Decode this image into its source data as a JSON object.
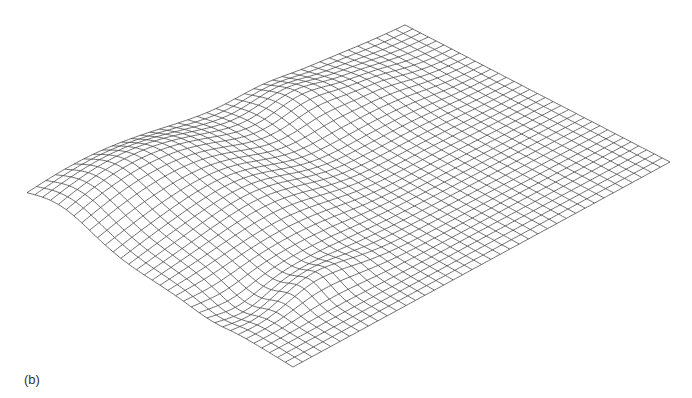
{
  "figure": {
    "panel_label": "(b)",
    "line_color": "#4a4a4a",
    "background": "#ffffff"
  },
  "chart_data": {
    "type": "surface",
    "title": "",
    "xlabel": "",
    "ylabel": "",
    "zlabel": "",
    "axes_visible": false,
    "grid": false,
    "legend": null,
    "render": "wireframe",
    "mesh_rows": 40,
    "mesh_cols": 34,
    "projected_corners": {
      "left": [
        27,
        204
      ],
      "top": [
        405,
        25
      ],
      "right": [
        670,
        162
      ],
      "bottom": [
        293,
        367
      ]
    },
    "features": [
      {
        "kind": "ridge",
        "description": "raised ridge running along back-left edge, highest near left corner",
        "u": [
          0.0,
          0.55
        ],
        "v": [
          0.0,
          0.35
        ],
        "height_px": 28
      },
      {
        "kind": "bump",
        "description": "broad hump in left-center region",
        "u": 0.32,
        "v": 0.35,
        "height_px": 22
      },
      {
        "kind": "bump",
        "description": "mound near back-right edge",
        "u": 0.62,
        "v": 0.12,
        "height_px": 16
      },
      {
        "kind": "fold",
        "description": "sharp crease near front-left edge",
        "u": [
          0.15,
          0.35
        ],
        "v": 0.8,
        "height_px": 14
      }
    ],
    "front_right_edge": "flat"
  }
}
